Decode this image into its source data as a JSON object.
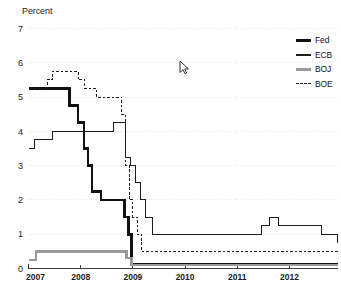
{
  "axis_title": "Percent",
  "legend": {
    "position": "top-right",
    "items": [
      {
        "label": "Fed",
        "style": "thick-solid",
        "color": "#111111",
        "key": "fed"
      },
      {
        "label": "ECB",
        "style": "thin-solid",
        "color": "#1d1d1d",
        "key": "ecb"
      },
      {
        "label": "BOJ",
        "style": "thick-solid-gray",
        "color": "#9a9a9a",
        "key": "boj"
      },
      {
        "label": "BOE",
        "style": "dashed",
        "color": "#1d1d1d",
        "key": "boe"
      }
    ]
  },
  "cursor": {
    "name": "mouse-pointer",
    "x": 179,
    "y": 60
  },
  "chart_data": {
    "type": "line",
    "title": "",
    "subtitle": "",
    "xlabel": "",
    "ylabel": "Percent",
    "ylim": [
      0,
      7
    ],
    "xlim": [
      2007.0,
      2012.92
    ],
    "yticks": [
      0,
      1,
      2,
      3,
      4,
      5,
      6,
      7
    ],
    "ytick_labels": [
      "0",
      "1",
      "2",
      "3",
      "4",
      "5",
      "6",
      "7"
    ],
    "xticks": [
      2007,
      2008,
      2009,
      2010,
      2011,
      2012
    ],
    "xtick_labels": [
      "2007",
      "2008",
      "2009",
      "2010",
      "2011",
      "2012"
    ],
    "grid": true,
    "grid_style": "dotted-horizontal",
    "interpolation": "step-post",
    "legend_position": "top-right",
    "series": [
      {
        "name": "Fed",
        "key": "fed",
        "color": "#111111",
        "style": "thick-solid",
        "x": [
          2007.0,
          2007.7,
          2007.78,
          2007.95,
          2008.06,
          2008.14,
          2008.22,
          2008.39,
          2008.84,
          2008.92,
          2008.97,
          2012.92
        ],
        "values": [
          5.25,
          5.25,
          4.75,
          4.25,
          3.5,
          3.0,
          2.25,
          2.0,
          1.5,
          1.0,
          0.125,
          0.125
        ]
      },
      {
        "name": "ECB",
        "key": "ecb",
        "color": "#1d1d1d",
        "style": "thin-solid",
        "x": [
          2007.0,
          2007.12,
          2007.25,
          2007.46,
          2008.52,
          2008.62,
          2008.79,
          2008.86,
          2008.95,
          2009.05,
          2009.15,
          2009.25,
          2009.38,
          2011.28,
          2011.46,
          2011.62,
          2011.79,
          2012.62,
          2012.92
        ],
        "values": [
          3.5,
          3.75,
          3.75,
          4.0,
          4.0,
          4.25,
          4.25,
          3.25,
          3.0,
          2.5,
          2.0,
          1.5,
          1.0,
          1.0,
          1.25,
          1.5,
          1.25,
          1.0,
          0.75
        ]
      },
      {
        "name": "BOJ",
        "key": "boj",
        "color": "#9a9a9a",
        "style": "thick-solid-gray",
        "x": [
          2007.0,
          2007.14,
          2008.72,
          2008.88,
          2008.97,
          2012.92
        ],
        "values": [
          0.25,
          0.5,
          0.5,
          0.3,
          0.1,
          0.1
        ]
      },
      {
        "name": "BOE",
        "key": "boe",
        "color": "#1d1d1d",
        "style": "dashed",
        "x": [
          2007.0,
          2007.25,
          2007.36,
          2007.46,
          2007.72,
          2007.95,
          2008.08,
          2008.3,
          2008.79,
          2008.86,
          2008.93,
          2009.0,
          2009.08,
          2009.17,
          2009.25,
          2012.92
        ],
        "values": [
          5.25,
          5.25,
          5.5,
          5.75,
          5.75,
          5.5,
          5.25,
          5.0,
          4.5,
          3.0,
          2.0,
          1.5,
          1.0,
          0.5,
          0.5,
          0.5
        ]
      }
    ]
  }
}
